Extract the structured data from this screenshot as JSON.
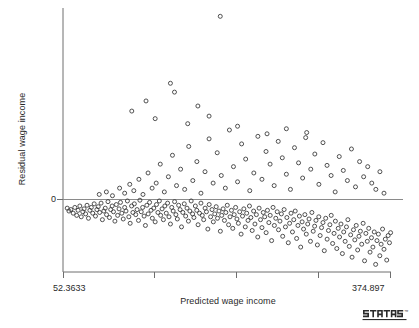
{
  "chart_data": {
    "type": "scatter",
    "title": "",
    "xlabel": "Predicted wage income",
    "ylabel": "Residual wage income",
    "xlim": [
      52.3633,
      374.897
    ],
    "ylim": [
      -95,
      150
    ],
    "grid": false,
    "legend": null,
    "xticklabels": [
      "52.3633",
      "374.897"
    ],
    "yticklabels": [
      "0"
    ],
    "yticks": [
      0
    ],
    "reference_line": {
      "orientation": "horizontal",
      "y": 0
    },
    "marker": {
      "shape": "open-circle",
      "size": 4,
      "color": "#3d3d3d"
    },
    "branding": "stata",
    "points": [
      [
        56.5,
        -12
      ],
      [
        58.2,
        -16
      ],
      [
        60.1,
        -14
      ],
      [
        62.4,
        -19
      ],
      [
        64.0,
        -11
      ],
      [
        65.8,
        -22
      ],
      [
        67.2,
        -15
      ],
      [
        68.9,
        -9
      ],
      [
        70.3,
        -24
      ],
      [
        71.8,
        -17
      ],
      [
        73.1,
        -13
      ],
      [
        74.6,
        -20
      ],
      [
        76.0,
        -8
      ],
      [
        77.4,
        -26
      ],
      [
        78.8,
        -15
      ],
      [
        80.2,
        -11
      ],
      [
        81.6,
        -19
      ],
      [
        83.0,
        -6
      ],
      [
        84.3,
        -23
      ],
      [
        85.7,
        -14
      ],
      [
        87.0,
        -10
      ],
      [
        88.4,
        -18
      ],
      [
        89.8,
        -5
      ],
      [
        91.1,
        -28
      ],
      [
        92.5,
        -16
      ],
      [
        93.9,
        -12
      ],
      [
        95.2,
        -21
      ],
      [
        96.6,
        -3
      ],
      [
        98.0,
        -25
      ],
      [
        99.3,
        -14
      ],
      [
        100.7,
        -9
      ],
      [
        102.0,
        -17
      ],
      [
        103.4,
        -30
      ],
      [
        104.8,
        -7
      ],
      [
        106.1,
        -22
      ],
      [
        107.5,
        -13
      ],
      [
        108.9,
        -4
      ],
      [
        110.2,
        -19
      ],
      [
        111.6,
        -27
      ],
      [
        113.0,
        -11
      ],
      [
        114.3,
        -16
      ],
      [
        115.7,
        -2
      ],
      [
        117.1,
        -24
      ],
      [
        118.4,
        -33
      ],
      [
        119.8,
        -9
      ],
      [
        121.1,
        -18
      ],
      [
        122.5,
        -6
      ],
      [
        123.9,
        -21
      ],
      [
        125.2,
        -14
      ],
      [
        126.6,
        -29
      ],
      [
        128.0,
        -1
      ],
      [
        129.3,
        -17
      ],
      [
        130.7,
        -11
      ],
      [
        132.1,
        -23
      ],
      [
        133.4,
        -36
      ],
      [
        134.8,
        -8
      ],
      [
        136.1,
        -20
      ],
      [
        137.5,
        -4
      ],
      [
        138.9,
        -15
      ],
      [
        140.2,
        -26
      ],
      [
        141.6,
        -12
      ],
      [
        143.0,
        -31
      ],
      [
        144.3,
        -7
      ],
      [
        145.7,
        -18
      ],
      [
        147.1,
        -2
      ],
      [
        148.4,
        -22
      ],
      [
        149.8,
        -13
      ],
      [
        151.1,
        -28
      ],
      [
        152.5,
        -9
      ],
      [
        153.9,
        -19
      ],
      [
        155.2,
        -5
      ],
      [
        156.6,
        -24
      ],
      [
        158.0,
        -34
      ],
      [
        159.3,
        -11
      ],
      [
        160.7,
        -16
      ],
      [
        162.1,
        -3
      ],
      [
        163.4,
        -21
      ],
      [
        164.8,
        -27
      ],
      [
        166.1,
        -8
      ],
      [
        167.5,
        -14
      ],
      [
        168.9,
        -38
      ],
      [
        170.2,
        -18
      ],
      [
        171.6,
        -6
      ],
      [
        173.0,
        -23
      ],
      [
        174.3,
        -12
      ],
      [
        175.7,
        -30
      ],
      [
        177.1,
        -16
      ],
      [
        178.4,
        -2
      ],
      [
        179.8,
        -20
      ],
      [
        181.1,
        -25
      ],
      [
        182.5,
        -9
      ],
      [
        183.9,
        -15
      ],
      [
        185.2,
        -35
      ],
      [
        186.6,
        -19
      ],
      [
        188.0,
        -5
      ],
      [
        189.3,
        -22
      ],
      [
        190.7,
        -28
      ],
      [
        192.1,
        -12
      ],
      [
        193.4,
        -17
      ],
      [
        194.8,
        -41
      ],
      [
        196.1,
        -7
      ],
      [
        197.5,
        -24
      ],
      [
        198.9,
        -14
      ],
      [
        200.2,
        -31
      ],
      [
        201.6,
        -20
      ],
      [
        203.0,
        -10
      ],
      [
        204.3,
        -26
      ],
      [
        205.7,
        -16
      ],
      [
        207.1,
        -44
      ],
      [
        208.4,
        -22
      ],
      [
        209.8,
        -13
      ],
      [
        211.1,
        -29
      ],
      [
        212.5,
        -18
      ],
      [
        213.9,
        -8
      ],
      [
        215.2,
        -35
      ],
      [
        216.6,
        -24
      ],
      [
        218.0,
        -15
      ],
      [
        219.3,
        -40
      ],
      [
        220.7,
        -21
      ],
      [
        222.1,
        -11
      ],
      [
        223.4,
        -27
      ],
      [
        224.8,
        -33
      ],
      [
        226.1,
        -17
      ],
      [
        227.5,
        -48
      ],
      [
        228.9,
        -23
      ],
      [
        230.2,
        -13
      ],
      [
        231.6,
        -38
      ],
      [
        233.0,
        -19
      ],
      [
        234.3,
        -29
      ],
      [
        235.7,
        -9
      ],
      [
        237.1,
        -25
      ],
      [
        238.4,
        -43
      ],
      [
        239.8,
        -16
      ],
      [
        241.1,
        -34
      ],
      [
        242.5,
        -21
      ],
      [
        243.9,
        -52
      ],
      [
        245.2,
        -12
      ],
      [
        246.6,
        -28
      ],
      [
        248.0,
        -39
      ],
      [
        249.3,
        -18
      ],
      [
        250.7,
        -24
      ],
      [
        252.1,
        -46
      ],
      [
        253.4,
        -15
      ],
      [
        254.8,
        -32
      ],
      [
        256.1,
        -22
      ],
      [
        257.5,
        -57
      ],
      [
        258.9,
        -11
      ],
      [
        260.2,
        -36
      ],
      [
        261.6,
        -26
      ],
      [
        263.0,
        -17
      ],
      [
        264.3,
        -42
      ],
      [
        265.7,
        -30
      ],
      [
        267.1,
        -20
      ],
      [
        268.4,
        -51
      ],
      [
        269.8,
        -14
      ],
      [
        271.1,
        -38
      ],
      [
        272.5,
        -25
      ],
      [
        273.9,
        -60
      ],
      [
        275.2,
        -33
      ],
      [
        276.6,
        -19
      ],
      [
        278.0,
        -45
      ],
      [
        279.3,
        -28
      ],
      [
        280.7,
        -16
      ],
      [
        282.1,
        -54
      ],
      [
        283.4,
        -36
      ],
      [
        284.8,
        -23
      ],
      [
        286.1,
        -66
      ],
      [
        287.5,
        -31
      ],
      [
        288.9,
        -41
      ],
      [
        290.2,
        -21
      ],
      [
        291.6,
        -48
      ],
      [
        293.0,
        -34
      ],
      [
        294.3,
        -27
      ],
      [
        295.7,
        -58
      ],
      [
        297.1,
        -18
      ],
      [
        298.4,
        -44
      ],
      [
        299.8,
        -37
      ],
      [
        301.1,
        -29
      ],
      [
        302.5,
        -63
      ],
      [
        303.9,
        -24
      ],
      [
        305.2,
        -50
      ],
      [
        306.6,
        -39
      ],
      [
        308.0,
        -32
      ],
      [
        309.3,
        -71
      ],
      [
        310.7,
        -26
      ],
      [
        312.1,
        -55
      ],
      [
        313.4,
        -43
      ],
      [
        314.8,
        -35
      ],
      [
        316.1,
        -22
      ],
      [
        317.5,
        -61
      ],
      [
        318.9,
        -47
      ],
      [
        320.2,
        -30
      ],
      [
        321.6,
        -68
      ],
      [
        323.0,
        -40
      ],
      [
        324.3,
        -52
      ],
      [
        325.7,
        -34
      ],
      [
        327.1,
        -75
      ],
      [
        328.4,
        -45
      ],
      [
        329.8,
        -58
      ],
      [
        331.1,
        -38
      ],
      [
        332.5,
        -28
      ],
      [
        333.9,
        -65
      ],
      [
        335.2,
        -49
      ],
      [
        336.6,
        -80
      ],
      [
        338.0,
        -42
      ],
      [
        339.3,
        -56
      ],
      [
        340.7,
        -36
      ],
      [
        342.1,
        -70
      ],
      [
        343.4,
        -51
      ],
      [
        344.8,
        -44
      ],
      [
        346.1,
        -62
      ],
      [
        347.5,
        -33
      ],
      [
        348.9,
        -85
      ],
      [
        350.2,
        -47
      ],
      [
        351.6,
        -58
      ],
      [
        353.0,
        -40
      ],
      [
        354.3,
        -73
      ],
      [
        355.7,
        -53
      ],
      [
        357.1,
        -66
      ],
      [
        358.4,
        -45
      ],
      [
        359.8,
        -90
      ],
      [
        361.1,
        -57
      ],
      [
        362.5,
        -48
      ],
      [
        363.9,
        -78
      ],
      [
        365.2,
        -62
      ],
      [
        366.6,
        -41
      ],
      [
        368.0,
        -69
      ],
      [
        369.3,
        -55
      ],
      [
        370.7,
        -84
      ],
      [
        372.1,
        -50
      ],
      [
        373.4,
        -60
      ],
      [
        374.5,
        -46
      ],
      [
        88.0,
        4
      ],
      [
        95.0,
        6
      ],
      [
        101.0,
        3
      ],
      [
        108.0,
        9
      ],
      [
        113.0,
        5
      ],
      [
        118.0,
        12
      ],
      [
        122.0,
        7
      ],
      [
        127.0,
        16
      ],
      [
        131.0,
        4
      ],
      [
        136.0,
        21
      ],
      [
        140.0,
        9
      ],
      [
        144.0,
        13
      ],
      [
        148.0,
        28
      ],
      [
        152.0,
        6
      ],
      [
        156.0,
        18
      ],
      [
        160.0,
        35
      ],
      [
        164.0,
        11
      ],
      [
        168.0,
        24
      ],
      [
        172.0,
        8
      ],
      [
        176.0,
        42
      ],
      [
        180.0,
        15
      ],
      [
        184.0,
        30
      ],
      [
        188.0,
        5
      ],
      [
        192.0,
        22
      ],
      [
        196.0,
        48
      ],
      [
        200.0,
        13
      ],
      [
        204.0,
        37
      ],
      [
        208.0,
        19
      ],
      [
        212.0,
        9
      ],
      [
        216.0,
        55
      ],
      [
        220.0,
        26
      ],
      [
        224.0,
        14
      ],
      [
        228.0,
        44
      ],
      [
        232.0,
        32
      ],
      [
        236.0,
        7
      ],
      [
        240.0,
        21
      ],
      [
        244.0,
        50
      ],
      [
        248.0,
        16
      ],
      [
        252.0,
        38
      ],
      [
        256.0,
        28
      ],
      [
        260.0,
        11
      ],
      [
        264.0,
        46
      ],
      [
        268.0,
        33
      ],
      [
        272.0,
        20
      ],
      [
        276.0,
        8
      ],
      [
        280.0,
        41
      ],
      [
        284.0,
        29
      ],
      [
        288.0,
        17
      ],
      [
        292.0,
        53
      ],
      [
        296.0,
        24
      ],
      [
        300.0,
        36
      ],
      [
        304.0,
        12
      ],
      [
        308.0,
        45
      ],
      [
        312.0,
        27
      ],
      [
        316.0,
        19
      ],
      [
        320.0,
        6
      ],
      [
        324.0,
        34
      ],
      [
        328.0,
        23
      ],
      [
        332.0,
        15
      ],
      [
        336.0,
        40
      ],
      [
        340.0,
        10
      ],
      [
        344.0,
        30
      ],
      [
        348.0,
        18
      ],
      [
        352.0,
        26
      ],
      [
        356.0,
        13
      ],
      [
        360.0,
        8
      ],
      [
        364.0,
        22
      ],
      [
        368.0,
        5
      ],
      [
        134.0,
        78
      ],
      [
        158.0,
        92
      ],
      [
        162.0,
        85
      ],
      [
        185.0,
        74
      ],
      [
        207.0,
        145
      ],
      [
        120.0,
        70
      ],
      [
        143.0,
        64
      ],
      [
        175.0,
        60
      ],
      [
        196.0,
        66
      ],
      [
        224.0,
        58
      ],
      [
        253.0,
        52
      ],
      [
        272.0,
        56
      ],
      [
        291.0,
        49
      ]
    ]
  },
  "branding": {
    "name": "stata-logo",
    "text": "STATA",
    "trademark": "™"
  }
}
